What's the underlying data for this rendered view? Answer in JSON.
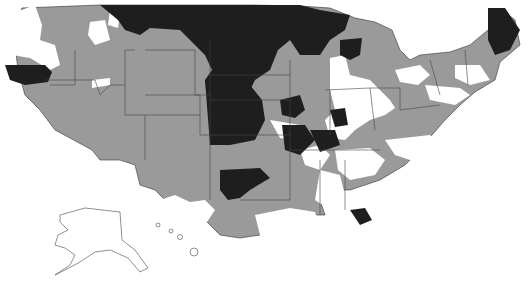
{
  "map": {
    "title": "",
    "type": "choropleth",
    "region": "United States (contiguous, Alaska, Hawaii insets)",
    "legend": [],
    "categories": [
      {
        "name": "none",
        "color": "#ffffff"
      },
      {
        "name": "medium",
        "color": "#9a9a9a"
      },
      {
        "name": "high",
        "color": "#1e1e1e"
      }
    ],
    "colors": {
      "background": "#ffffff",
      "outline": "#333333",
      "white": "#ffffff",
      "gray": "#9a9a9a",
      "black": "#1e1e1e"
    }
  }
}
